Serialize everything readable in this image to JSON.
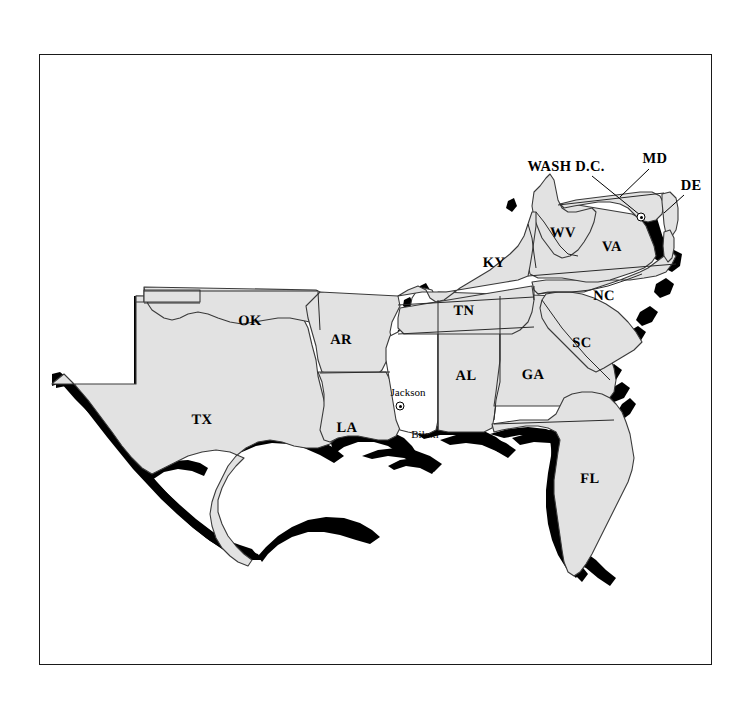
{
  "figure": {
    "background_color": "#ffffff",
    "frame_color": "#1a1a1a",
    "land_fill_color": "#e2e2e2",
    "highlight_fill_color": "#ffffff",
    "shadow_color": "#000000",
    "border_line_color": "#3a3a3a"
  },
  "state_labels": [
    {
      "name": "oklahoma",
      "abbr": "OK",
      "x": 250,
      "y": 321
    },
    {
      "name": "arkansas",
      "abbr": "AR",
      "x": 341,
      "y": 340
    },
    {
      "name": "texas",
      "abbr": "TX",
      "x": 202,
      "y": 420
    },
    {
      "name": "louisiana",
      "abbr": "LA",
      "x": 347,
      "y": 428
    },
    {
      "name": "tennessee",
      "abbr": "TN",
      "x": 464,
      "y": 311
    },
    {
      "name": "kentucky",
      "abbr": "KY",
      "x": 494,
      "y": 263
    },
    {
      "name": "alabama",
      "abbr": "AL",
      "x": 466,
      "y": 376
    },
    {
      "name": "georgia",
      "abbr": "GA",
      "x": 533,
      "y": 375
    },
    {
      "name": "florida",
      "abbr": "FL",
      "x": 590,
      "y": 479
    },
    {
      "name": "south-carolina",
      "abbr": "SC",
      "x": 582,
      "y": 343
    },
    {
      "name": "north-carolina",
      "abbr": "NC",
      "x": 604,
      "y": 296
    },
    {
      "name": "virginia",
      "abbr": "VA",
      "x": 612,
      "y": 247
    },
    {
      "name": "west-virginia",
      "abbr": "WV",
      "x": 563,
      "y": 233
    }
  ],
  "callout_labels": [
    {
      "name": "washington-dc",
      "text": "WASH D.C.",
      "x": 566,
      "y": 166,
      "leader": {
        "x1": 592,
        "y1": 176,
        "x2": 640,
        "y2": 216
      }
    },
    {
      "name": "maryland",
      "text": "MD",
      "x": 655,
      "y": 158,
      "leader": {
        "x1": 650,
        "y1": 168,
        "x2": 622,
        "y2": 196
      }
    },
    {
      "name": "delaware",
      "text": "DE",
      "x": 691,
      "y": 185,
      "leader": {
        "x1": 684,
        "y1": 195,
        "x2": 665,
        "y2": 212
      }
    }
  ],
  "cities": [
    {
      "name": "jackson",
      "label": "Jackson",
      "label_x": 408,
      "label_y": 392,
      "marker_x": 400,
      "marker_y": 406,
      "has_marker": true
    },
    {
      "name": "biloxi",
      "label": "Biloxi",
      "label_x": 425,
      "label_y": 434,
      "marker_x": 0,
      "marker_y": 0,
      "has_marker": false
    },
    {
      "name": "washington-dc-point",
      "label": "",
      "label_x": 0,
      "label_y": 0,
      "marker_x": 641,
      "marker_y": 217,
      "has_marker": true
    }
  ],
  "highlighted_state": {
    "name": "mississippi",
    "fill": "#ffffff",
    "note": "Mississippi rendered unfilled (white) with no abbreviation label"
  },
  "legend_note": "Coastlines and selected borders carry a heavy black offset shadow toward the south/west."
}
